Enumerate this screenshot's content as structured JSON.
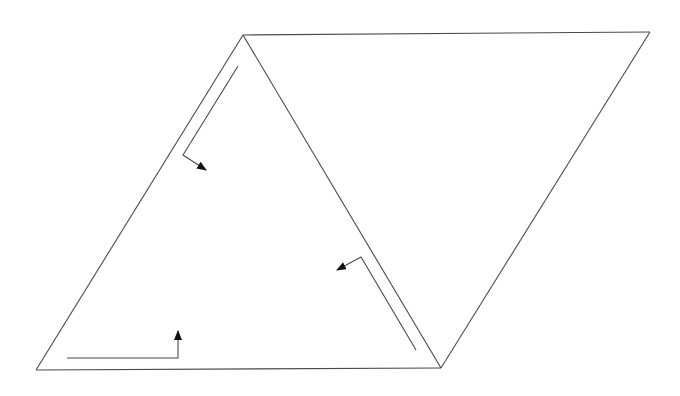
{
  "diagram": {
    "colors": {
      "background": "#ffffff",
      "edge": "#4a4a4a",
      "arrowhead": "#111111"
    },
    "vertices": {
      "top_left": [
        243,
        35
      ],
      "top_right": [
        650,
        32
      ],
      "bottom_right": [
        441,
        368
      ],
      "bottom_left": [
        36,
        370
      ]
    },
    "edges": [
      {
        "name": "top-edge",
        "from": [
          243,
          35
        ],
        "to": [
          650,
          32
        ]
      },
      {
        "name": "right-edge",
        "from": [
          650,
          32
        ],
        "to": [
          441,
          368
        ]
      },
      {
        "name": "bottom-edge",
        "from": [
          441,
          368
        ],
        "to": [
          36,
          370
        ]
      },
      {
        "name": "left-edge",
        "from": [
          36,
          370
        ],
        "to": [
          243,
          35
        ]
      },
      {
        "name": "diagonal",
        "from": [
          243,
          35
        ],
        "to": [
          441,
          368
        ]
      }
    ],
    "arrows": [
      {
        "name": "arrow-left-edge",
        "path": [
          [
            238,
            66
          ],
          [
            183,
            155
          ],
          [
            206,
            170
          ]
        ],
        "direction": "down-left then right-down"
      },
      {
        "name": "arrow-diagonal",
        "path": [
          [
            416,
            350
          ],
          [
            361,
            257
          ],
          [
            337,
            270
          ]
        ],
        "direction": "up-left then left-down"
      },
      {
        "name": "arrow-bottom-edge",
        "path": [
          [
            67,
            358
          ],
          [
            178,
            358
          ],
          [
            178,
            331
          ]
        ],
        "direction": "right then up"
      }
    ]
  }
}
